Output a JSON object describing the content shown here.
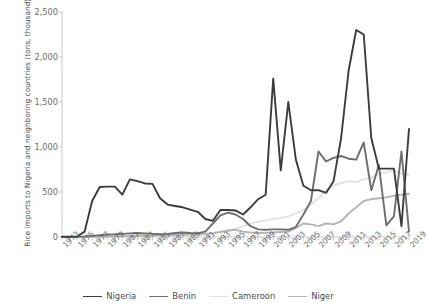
{
  "chart_data": {
    "type": "line",
    "title": "",
    "xlabel": "",
    "ylabel": "Rice imports to Nigeria and neighboring countries (tons, thousand)",
    "xlim": [
      1973,
      2019
    ],
    "ylim": [
      0,
      2500
    ],
    "ytick_labels": [
      "2,500",
      "2,000",
      "1,500",
      "1,000",
      "500",
      "0"
    ],
    "ytick_values": [
      2500,
      2000,
      1500,
      1000,
      500,
      0
    ],
    "grid": false,
    "legend_position": "bottom",
    "x": [
      1973,
      1974,
      1975,
      1976,
      1977,
      1978,
      1979,
      1980,
      1981,
      1982,
      1983,
      1984,
      1985,
      1986,
      1987,
      1988,
      1989,
      1990,
      1991,
      1992,
      1993,
      1994,
      1995,
      1996,
      1997,
      1998,
      1999,
      2000,
      2001,
      2002,
      2003,
      2004,
      2005,
      2006,
      2007,
      2008,
      2009,
      2010,
      2011,
      2012,
      2013,
      2014,
      2015,
      2016,
      2017,
      2018,
      2019
    ],
    "xtick_labels": [
      "1973",
      "1975",
      "1977",
      "1979",
      "1981",
      "1983",
      "1985",
      "1987",
      "1989",
      "1991",
      "1993",
      "1995",
      "1997",
      "1999",
      "2001",
      "2003",
      "2005",
      "2007",
      "2009",
      "2011",
      "2013",
      "2015",
      "2017",
      "2019"
    ],
    "series": [
      {
        "name": "Nigeria",
        "color": "#3c3c3c",
        "width": 1.9,
        "values": [
          2,
          3,
          6,
          60,
          400,
          555,
          560,
          560,
          470,
          640,
          620,
          595,
          590,
          430,
          360,
          345,
          330,
          305,
          280,
          200,
          180,
          300,
          300,
          295,
          250,
          330,
          420,
          470,
          1760,
          740,
          1500,
          860,
          570,
          520,
          520,
          490,
          620,
          1100,
          1850,
          2300,
          2250,
          1100,
          760,
          760,
          760,
          120,
          1200
        ]
      },
      {
        "name": "Benin",
        "color": "#6e6e6e",
        "width": 1.9,
        "values": [
          1,
          1,
          2,
          5,
          12,
          20,
          28,
          30,
          35,
          40,
          45,
          40,
          35,
          30,
          35,
          45,
          50,
          45,
          42,
          60,
          150,
          240,
          270,
          250,
          200,
          120,
          85,
          80,
          85,
          85,
          80,
          110,
          250,
          400,
          950,
          840,
          880,
          900,
          870,
          860,
          1050,
          520,
          800,
          130,
          230,
          950,
          60
        ]
      },
      {
        "name": "Cameroon",
        "color": "#e2e2e2",
        "width": 1.9,
        "values": [
          1,
          1,
          1,
          2,
          3,
          5,
          8,
          10,
          12,
          15,
          18,
          20,
          22,
          25,
          28,
          30,
          33,
          35,
          38,
          40,
          45,
          60,
          75,
          90,
          120,
          150,
          170,
          185,
          200,
          210,
          230,
          260,
          300,
          360,
          430,
          520,
          570,
          600,
          620,
          610,
          640,
          660,
          700,
          720,
          740,
          700,
          690
        ]
      },
      {
        "name": "Niger",
        "color": "#b4b4b4",
        "width": 1.9,
        "values": [
          1,
          1,
          1,
          2,
          3,
          4,
          5,
          6,
          8,
          10,
          12,
          14,
          16,
          18,
          20,
          22,
          25,
          28,
          30,
          32,
          40,
          55,
          70,
          80,
          60,
          50,
          45,
          48,
          50,
          55,
          60,
          100,
          150,
          140,
          120,
          150,
          140,
          175,
          260,
          330,
          400,
          420,
          430,
          440,
          460,
          470,
          480
        ]
      }
    ],
    "legend": [
      {
        "label": "Nigeria",
        "color": "#3c3c3c"
      },
      {
        "label": "Benin",
        "color": "#6e6e6e"
      },
      {
        "label": "Cameroon",
        "color": "#e2e2e2"
      },
      {
        "label": "Niger",
        "color": "#b4b4b4"
      }
    ]
  }
}
